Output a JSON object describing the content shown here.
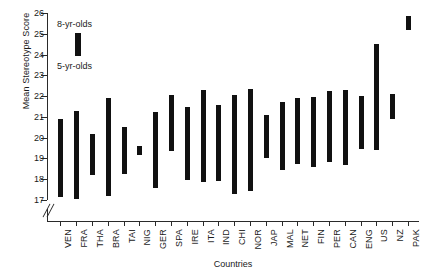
{
  "chart_data": {
    "type": "bar",
    "subtype": "range-bar",
    "title": "",
    "xlabel": "Countries",
    "ylabel": "Mean Stereotype Score",
    "ylim": [
      17,
      26
    ],
    "yticks": [
      17,
      18,
      19,
      20,
      21,
      22,
      23,
      24,
      25,
      26
    ],
    "grid": false,
    "axis_break": true,
    "axis_break_note": "y-axis broken below 17",
    "legend_position": "upper-left",
    "series": [
      {
        "name": "5-yr-olds",
        "values": [
          17.15,
          17.05,
          18.2,
          17.2,
          18.25,
          19.15,
          17.6,
          19.35,
          17.95,
          17.85,
          17.9,
          17.3,
          17.45,
          19.0,
          18.45,
          18.75,
          18.6,
          18.85,
          18.7,
          19.45,
          19.4,
          20.9,
          25.2
        ]
      },
      {
        "name": "8-yr-olds",
        "values": [
          20.9,
          21.3,
          20.2,
          21.9,
          20.5,
          19.6,
          21.25,
          22.05,
          21.5,
          22.3,
          21.55,
          22.05,
          22.35,
          21.1,
          21.7,
          21.9,
          21.95,
          22.25,
          22.3,
          22.0,
          24.5,
          22.1,
          25.85
        ]
      }
    ],
    "categories": [
      "VEN",
      "FRA",
      "THA",
      "BRA",
      "TAI",
      "NIG",
      "GER",
      "SPA",
      "IRE",
      "ITA",
      "IND",
      "CHI",
      "NOR",
      "JAP",
      "MAL",
      "NET",
      "FIN",
      "PER",
      "CAN",
      "ENG",
      "US",
      "NZ",
      "PAK"
    ],
    "legend": [
      {
        "label": "8-yr-olds",
        "position": "top-of-bar"
      },
      {
        "label": "5-yr-olds",
        "position": "bottom-of-bar"
      }
    ],
    "bar_color": "#111111",
    "legend_sample": {
      "top": 25.05,
      "bottom": 23.95
    }
  }
}
